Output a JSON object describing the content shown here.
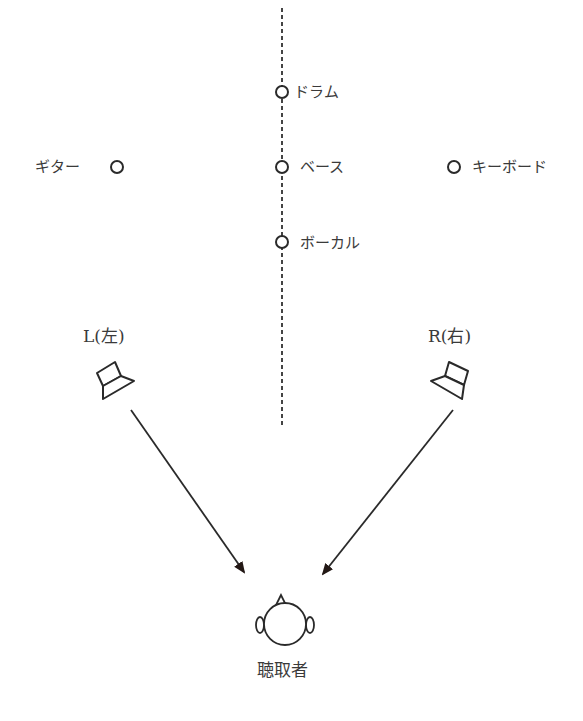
{
  "diagram": {
    "type": "stereo-sound-image",
    "center_line": "dashed",
    "instruments": [
      {
        "id": "drums",
        "label": "ドラム",
        "position": "center",
        "depth": "back"
      },
      {
        "id": "guitar",
        "label": "ギター",
        "position": "left",
        "depth": "middle"
      },
      {
        "id": "bass",
        "label": "ベース",
        "position": "center",
        "depth": "middle"
      },
      {
        "id": "keyboard",
        "label": "キーボード",
        "position": "right",
        "depth": "middle"
      },
      {
        "id": "vocal",
        "label": "ボーカル",
        "position": "center",
        "depth": "front"
      }
    ],
    "speakers": [
      {
        "id": "left",
        "label": "L(左)"
      },
      {
        "id": "right",
        "label": "R(右)"
      }
    ],
    "listener": {
      "label": "聴取者"
    },
    "colors": {
      "stroke": "#2a2a2a",
      "text": "#3a3a3a",
      "arrow": "#231815"
    }
  }
}
